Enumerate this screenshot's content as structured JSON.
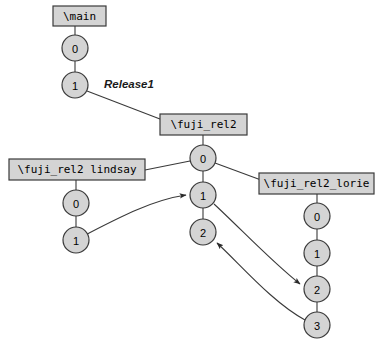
{
  "diagram": {
    "background_color": "#ffffff",
    "shape_fill_color": "#d4d4d4",
    "shape_stroke_color": "#3a3a3a",
    "line_color": "#3a3a3a",
    "text_color": "#000000",
    "branches": [
      {
        "id": "main",
        "label": "\\main",
        "box": {
          "x": 53,
          "y": 6,
          "width": 53,
          "height": 20
        },
        "nodes": [
          {
            "label": "0",
            "cx": 75,
            "cy": 48,
            "r": 13
          },
          {
            "label": "1",
            "cx": 75,
            "cy": 85,
            "r": 13
          }
        ]
      },
      {
        "id": "fuji_rel2",
        "label": "\\fuji_rel2",
        "box": {
          "x": 160,
          "y": 114,
          "width": 87,
          "height": 21
        },
        "nodes": [
          {
            "label": "0",
            "cx": 203,
            "cy": 158,
            "r": 13
          },
          {
            "label": "1",
            "cx": 203,
            "cy": 195,
            "r": 13
          },
          {
            "label": "2",
            "cx": 203,
            "cy": 232,
            "r": 13
          }
        ]
      },
      {
        "id": "fuji_rel2_lindsay",
        "label": "\\fuji_rel2 lindsay",
        "box": {
          "x": 9,
          "y": 159,
          "width": 136,
          "height": 21
        },
        "nodes": [
          {
            "label": "0",
            "cx": 76,
            "cy": 203,
            "r": 13
          },
          {
            "label": "1",
            "cx": 76,
            "cy": 240,
            "r": 13
          }
        ]
      },
      {
        "id": "fuji_rel2_lorie",
        "label": "\\fuji_rel2_lorie",
        "box": {
          "x": 259,
          "y": 173,
          "width": 115,
          "height": 21
        },
        "nodes": [
          {
            "label": "0",
            "cx": 317,
            "cy": 216,
            "r": 13
          },
          {
            "label": "1",
            "cx": 317,
            "cy": 253,
            "r": 13
          },
          {
            "label": "2",
            "cx": 317,
            "cy": 289,
            "r": 13
          },
          {
            "label": "3",
            "cx": 317,
            "cy": 325,
            "r": 13
          }
        ]
      }
    ],
    "tags": [
      {
        "label": "Release1",
        "x": 104,
        "y": 85
      }
    ],
    "connectors": [
      {
        "name": "main-box-to-main-0",
        "kind": "line",
        "arrow": false
      },
      {
        "name": "main-0-to-main-1",
        "kind": "line",
        "arrow": false
      },
      {
        "name": "main-1-to-fuji-rel2-box",
        "kind": "line",
        "arrow": false
      },
      {
        "name": "fuji-rel2-box-to-fuji-0",
        "kind": "line",
        "arrow": false
      },
      {
        "name": "fuji-0-to-fuji-1",
        "kind": "line",
        "arrow": false
      },
      {
        "name": "fuji-1-to-fuji-2",
        "kind": "line",
        "arrow": false
      },
      {
        "name": "fuji-0-to-lindsay-box",
        "kind": "line",
        "arrow": false
      },
      {
        "name": "fuji-0-to-lorie-box",
        "kind": "line",
        "arrow": false
      },
      {
        "name": "lindsay-box-to-lindsay-0",
        "kind": "line",
        "arrow": false
      },
      {
        "name": "lindsay-0-to-lindsay-1",
        "kind": "line",
        "arrow": false
      },
      {
        "name": "lorie-box-to-lorie-0",
        "kind": "line",
        "arrow": false
      },
      {
        "name": "lorie-0-to-lorie-1",
        "kind": "line",
        "arrow": false
      },
      {
        "name": "lorie-1-to-lorie-2",
        "kind": "line",
        "arrow": false
      },
      {
        "name": "lorie-2-to-lorie-3",
        "kind": "line",
        "arrow": false
      },
      {
        "name": "merge-lindsay-1-to-fuji-1",
        "kind": "curve",
        "arrow": true
      },
      {
        "name": "merge-fuji-1-to-lorie-2",
        "kind": "curve",
        "arrow": true
      },
      {
        "name": "merge-lorie-3-to-fuji-2",
        "kind": "curve",
        "arrow": true
      }
    ]
  }
}
